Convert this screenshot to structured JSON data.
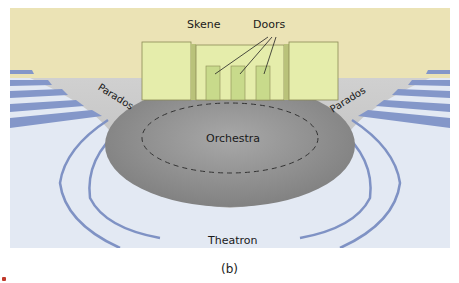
{
  "figure": {
    "caption": "(b)",
    "labels": {
      "skene": "Skene",
      "doors": "Doors",
      "parados_left": "Parados",
      "parados_right": "Parados",
      "orchestra": "Orchestra",
      "theatron": "Theatron"
    },
    "door_count": 3,
    "colors": {
      "background_top": "#e9e2b4",
      "skene_fill": "#e4ecaa",
      "door_fill": "#c7d98a",
      "orchestra_fill": "#8f8f8f",
      "ground_fill": "#c6c6c6",
      "seats_fill": "#e2e8f3",
      "seat_edge": "#7f92c4"
    }
  }
}
